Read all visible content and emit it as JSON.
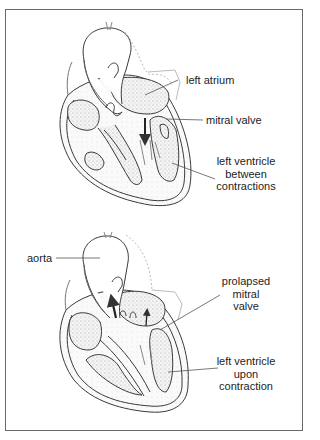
{
  "figure": {
    "top_panel": {
      "state": "normal",
      "labels": {
        "left_atrium": "left atrium",
        "mitral_valve": "mitral valve",
        "left_ventricle": [
          "left ventricle",
          "between",
          "contractions"
        ]
      }
    },
    "bottom_panel": {
      "state": "prolapse",
      "labels": {
        "aorta": "aorta",
        "prolapsed_mitral_valve": [
          "prolapsed",
          "mitral",
          "valve"
        ],
        "left_ventricle": [
          "left ventricle",
          "upon",
          "contraction"
        ]
      }
    },
    "colors": {
      "border": "#6a6a6a",
      "ink": "#3a3a3a",
      "stipple": "#cfcfcf",
      "text": "#232323"
    }
  }
}
